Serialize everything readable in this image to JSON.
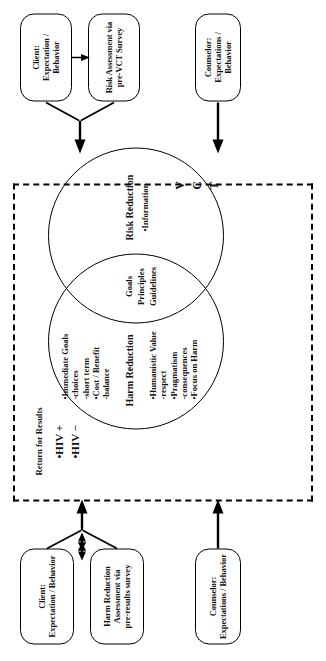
{
  "diagram": {
    "title_hidden": "VCT Harm Reduction / Risk Reduction model",
    "top_boxes": {
      "client_expectation": "Client:\nExpectation / Behavior",
      "harm_reduction_assessment": "Harm Reduction\nAssessment via\npre-results survey",
      "counselor_expectations": "Counselor:\nExpectations / Behavior"
    },
    "bottom_boxes": {
      "client_expectation": "Client:\nExpectation / Behavior",
      "risk_assessment": "Risk Assessment via\npre-VCT Survey",
      "counselor_expectations": "Counselor:\nExpectations / Behavior"
    },
    "return_for_results": "Return for Results",
    "hiv_positive": "•HIV +",
    "hiv_negative": "•HIV −",
    "vct_letters": [
      "V",
      "C",
      "T"
    ],
    "left_circle": {
      "title": "Harm Reduction",
      "column_left": "•Humanistic Value\n   -respect\n•Pragmatism\n   -consequences\n•Focus on Harm",
      "column_right": "•Immediate Goals\n   -choices\n   -short term\n•Cost / Benefit\n   -balance"
    },
    "overlap": {
      "line1": "Goals",
      "line2": "Principles",
      "line3": "Guidelines"
    },
    "right_circle": {
      "title": "Risk Reduction",
      "items": "•Information"
    },
    "colors": {
      "stroke": "#000000",
      "background": "#ffffff"
    }
  }
}
